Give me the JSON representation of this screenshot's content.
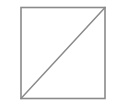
{
  "figure": {
    "title": "Square with diagonal",
    "background_color": "#ffffff",
    "stroke_color": "#8a8a8a",
    "fill_color": "#ffffff",
    "stroke_width": 1.6,
    "canvas": {
      "width": 117,
      "height": 107
    },
    "shapes": [
      {
        "name": "square",
        "type": "rect",
        "x": 21,
        "y": 7.5,
        "width": 84,
        "height": 91,
        "stroke": "#8a8a8a",
        "fill": "#ffffff",
        "stroke_width": 1.6
      },
      {
        "name": "diagonal",
        "type": "line",
        "x1": 21,
        "y1": 98.5,
        "x2": 105,
        "y2": 7.5,
        "stroke": "#8a8a8a",
        "stroke_width": 1.5
      }
    ],
    "vertices": [
      {
        "name": "top-left",
        "x": 21,
        "y": 7.5
      },
      {
        "name": "top-right",
        "x": 105,
        "y": 7.5
      },
      {
        "name": "bottom-right",
        "x": 105,
        "y": 98.5
      },
      {
        "name": "bottom-left",
        "x": 21,
        "y": 98.5
      }
    ],
    "labels": []
  }
}
